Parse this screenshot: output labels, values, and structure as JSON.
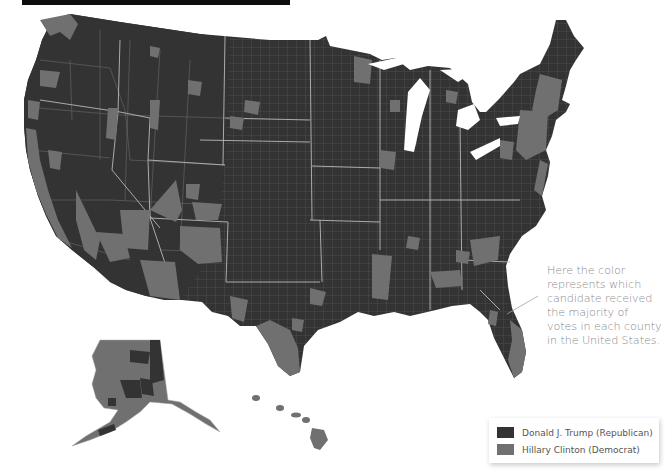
{
  "header": {
    "bar_color": "#0d0d0d"
  },
  "map": {
    "title_hidden": true,
    "region": "United States",
    "unit": "county",
    "colors": {
      "republican": "#333333",
      "democrat": "#707070",
      "borders": "#d0d0d0",
      "background": "#ffffff"
    }
  },
  "annotation": {
    "lines": [
      "Here the color",
      "represents which",
      "candidate received",
      "the majority of",
      "votes in each county",
      "in the United States."
    ]
  },
  "legend": {
    "items": [
      {
        "label": "Donald J. Trump (Republican)",
        "color": "#333333"
      },
      {
        "label": "Hillary Clinton (Democrat)",
        "color": "#707070"
      }
    ]
  }
}
